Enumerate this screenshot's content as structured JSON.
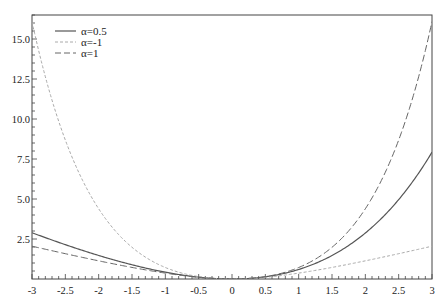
{
  "chart_data": {
    "type": "line",
    "title": "",
    "xlabel": "",
    "ylabel": "",
    "xlim": [
      -3,
      3
    ],
    "ylim": [
      0,
      16.5
    ],
    "grid": false,
    "legend_position": "upper left",
    "formula": "f(x) = (exp(alpha*x) - 1 - alpha*x) / alpha^2",
    "x_ticks": [
      -3,
      -2.5,
      -2,
      -1.5,
      -1,
      -0.5,
      0,
      0.5,
      1,
      1.5,
      2,
      2.5,
      3
    ],
    "x_tick_labels": [
      "-3",
      "-2.5",
      "-2",
      "-1.5",
      "-1",
      "-0.5",
      "0",
      "0.5",
      "1",
      "1.5",
      "2",
      "2.5",
      "3"
    ],
    "y_ticks": [
      2.5,
      5.0,
      7.5,
      10.0,
      12.5,
      15.0
    ],
    "y_tick_labels": [
      "2.5",
      "5.0",
      "7.5",
      "10.0",
      "12.5",
      "15.0"
    ],
    "x_minor_step": 0.1,
    "y_minor_step": 0.5,
    "x": [
      -3,
      -2.5,
      -2,
      -1.5,
      -1,
      -0.5,
      0,
      0.5,
      1,
      1.5,
      2,
      2.5,
      3
    ],
    "series": [
      {
        "name": "α=0.5",
        "alpha": 0.5,
        "style": "solid",
        "color": "#555555",
        "values": [
          2.89,
          2.23,
          1.47,
          0.89,
          0.43,
          0.12,
          0,
          0.13,
          0.59,
          1.45,
          2.87,
          5.08,
          7.93
        ]
      },
      {
        "name": "α=-1",
        "alpha": -1,
        "style": "short-dash",
        "color": "#aaaaaa",
        "values": [
          16.09,
          8.68,
          4.39,
          2.98,
          1.72,
          0.65,
          0,
          0.11,
          0.37,
          0.72,
          1.14,
          1.58,
          2.05
        ]
      },
      {
        "name": "α=1",
        "alpha": 1,
        "style": "long-dash",
        "color": "#666666",
        "values": [
          2.05,
          1.58,
          1.14,
          0.72,
          0.37,
          0.11,
          0,
          0.15,
          0.72,
          1.98,
          4.39,
          8.68,
          16.09
        ]
      }
    ]
  },
  "legend": {
    "items": [
      {
        "label": "α=0.5"
      },
      {
        "label": "α=-1"
      },
      {
        "label": "α=1"
      }
    ]
  }
}
